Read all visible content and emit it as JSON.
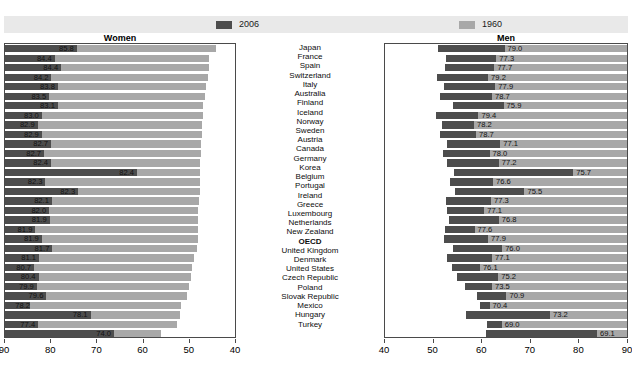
{
  "legend": {
    "series": [
      {
        "key": "s2006",
        "label": "2006",
        "color": "#4d4d4d"
      },
      {
        "key": "s1960",
        "label": "1960",
        "color": "#a8a8a8"
      }
    ]
  },
  "panels": {
    "left_title": "Women",
    "right_title": "Men"
  },
  "axis": {
    "women_ticks": [
      "90",
      "80",
      "70",
      "60",
      "50",
      "40"
    ],
    "men_ticks": [
      "40",
      "50",
      "60",
      "70",
      "80",
      "90"
    ]
  },
  "chart_data": {
    "type": "bar",
    "title": "",
    "subtitle": "",
    "xlabel": "",
    "ylabel": "",
    "orientation": "horizontal",
    "layout": "back-to-back paired panels",
    "legend_position": "top",
    "grid": false,
    "panels": [
      {
        "name": "Women",
        "xlim": [
          90,
          40
        ],
        "direction": "reversed",
        "axis_ticks": [
          90,
          80,
          70,
          60,
          50,
          40
        ]
      },
      {
        "name": "Men",
        "xlim": [
          40,
          90
        ],
        "direction": "normal",
        "axis_ticks": [
          40,
          50,
          60,
          70,
          80,
          90
        ]
      }
    ],
    "categories": [
      "Japan",
      "France",
      "Spain",
      "Switzerland",
      "Italy",
      "Australia",
      "Finland",
      "Iceland",
      "Norway",
      "Sweden",
      "Austria",
      "Canada",
      "Germany",
      "Korea",
      "Belgium",
      "Portugal",
      "Ireland",
      "Greece",
      "Luxembourg",
      "Netherlands",
      "New Zealand",
      "OECD",
      "United Kingdom",
      "Denmark",
      "United States",
      "Czech Republic",
      "Poland",
      "Slovak Republic",
      "Mexico",
      "Hungary",
      "Turkey"
    ],
    "highlighted_categories": [
      "OECD"
    ],
    "series": [
      {
        "name": "Women 2006",
        "panel": "Women",
        "color": "#4d4d4d",
        "values": [
          85.8,
          84.4,
          84.4,
          84.2,
          83.8,
          83.5,
          83.1,
          83.0,
          82.9,
          82.9,
          82.7,
          82.7,
          82.4,
          82.4,
          82.3,
          82.3,
          82.1,
          82.0,
          81.9,
          81.9,
          81.9,
          81.7,
          81.1,
          80.7,
          80.4,
          79.9,
          79.6,
          78.2,
          78.1,
          77.4,
          74.0
        ]
      },
      {
        "name": "Women 1960",
        "panel": "Women",
        "color": "#a8a8a8",
        "values": [
          70.2,
          73.6,
          72.2,
          74.1,
          72.3,
          73.9,
          71.6,
          75.0,
          75.8,
          74.9,
          72.7,
          74.2,
          72.4,
          53.7,
          73.5,
          66.4,
          71.9,
          72.4,
          72.2,
          75.3,
          73.9,
          71.4,
          73.7,
          74.4,
          73.1,
          73.0,
          70.6,
          72.7,
          59.5,
          70.2,
          50.3
        ]
      },
      {
        "name": "Men 2006",
        "panel": "Men",
        "color": "#4d4d4d",
        "values": [
          79.0,
          77.3,
          77.7,
          79.2,
          77.9,
          78.7,
          75.9,
          79.4,
          78.2,
          78.7,
          77.1,
          78.0,
          77.2,
          75.7,
          76.6,
          75.5,
          77.3,
          77.1,
          76.8,
          77.6,
          77.9,
          76.0,
          77.1,
          76.1,
          75.2,
          73.5,
          70.9,
          70.4,
          73.2,
          69.0,
          69.1
        ]
      },
      {
        "name": "Men 1960",
        "panel": "Men",
        "color": "#a8a8a8",
        "values": [
          65.3,
          67.0,
          67.4,
          68.7,
          67.2,
          67.9,
          65.5,
          70.7,
          71.6,
          71.2,
          66.2,
          68.4,
          66.5,
          51.1,
          67.7,
          61.2,
          68.1,
          69.5,
          66.5,
          71.5,
          68.7,
          65.8,
          67.9,
          70.4,
          66.6,
          67.9,
          64.9,
          68.4,
          55.9,
          65.9,
          46.2
        ]
      }
    ]
  }
}
